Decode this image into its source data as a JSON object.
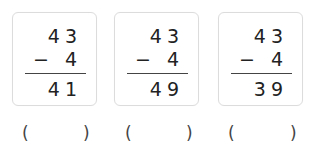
{
  "problems": [
    {
      "minuend": "43",
      "operator": "−",
      "subtrahend": "4",
      "result": "41",
      "answer_open": "(",
      "answer_close": ")"
    },
    {
      "minuend": "43",
      "operator": "−",
      "subtrahend": "4",
      "result": "49",
      "answer_open": "(",
      "answer_close": ")"
    },
    {
      "minuend": "43",
      "operator": "−",
      "subtrahend": "4",
      "result": "39",
      "answer_open": "(",
      "answer_close": ")"
    }
  ]
}
